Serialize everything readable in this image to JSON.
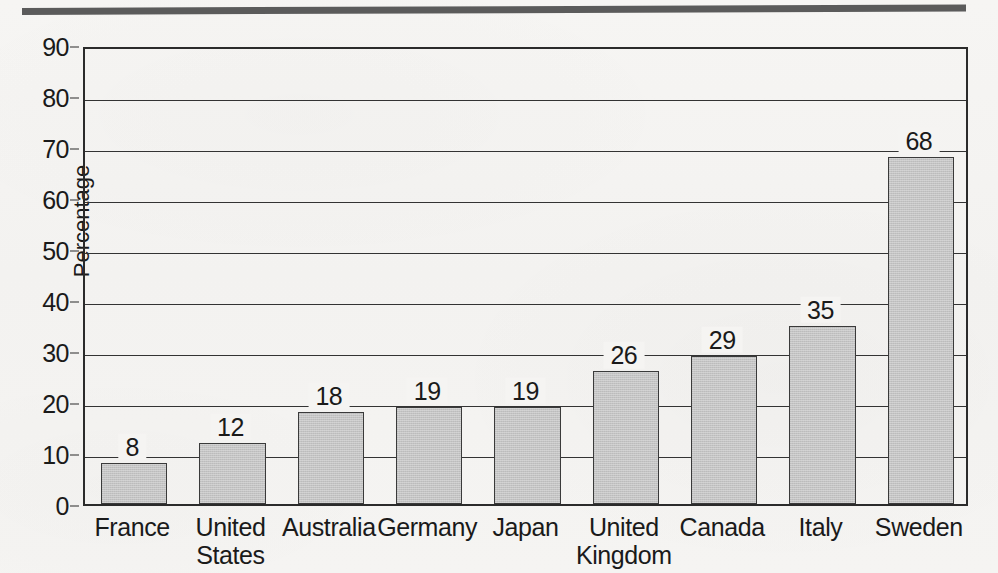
{
  "chart_data": {
    "type": "bar",
    "title": "",
    "xlabel": "",
    "ylabel": "Percentage",
    "ylim": [
      0,
      90
    ],
    "ytick_step": 10,
    "yticks": [
      "90",
      "80",
      "70",
      "60",
      "50",
      "40",
      "30",
      "20",
      "10",
      "0"
    ],
    "grid": true,
    "legend": "none",
    "categories": [
      "France",
      "United\nStates",
      "Australia",
      "Germany",
      "Japan",
      "United\nKingdom",
      "Canada",
      "Italy",
      "Sweden"
    ],
    "values": [
      8,
      12,
      18,
      19,
      19,
      26,
      29,
      35,
      68
    ],
    "value_labels": [
      "8",
      "12",
      "18",
      "19",
      "19",
      "26",
      "29",
      "35",
      "68"
    ],
    "bar_fill_color": "#c4c4c4",
    "bar_outline_color": "#3a3a3a",
    "axis_color": "#2b2b2b",
    "page_background": "#f5f4f2",
    "rule_color": "#5b5b5b"
  }
}
